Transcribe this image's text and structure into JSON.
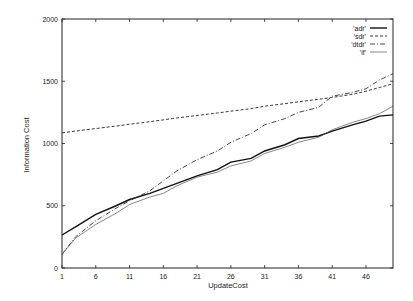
{
  "chart_data": {
    "type": "line",
    "title": "",
    "xlabel": "UpdateCost",
    "ylabel": "Information Cost",
    "xlim": [
      1,
      50
    ],
    "ylim": [
      0,
      2000
    ],
    "xticks": [
      1,
      6,
      11,
      16,
      21,
      26,
      31,
      36,
      41,
      46
    ],
    "yticks": [
      0,
      500,
      1000,
      1500,
      2000
    ],
    "grid": false,
    "legend_position": "top-right",
    "x": [
      1,
      3,
      6,
      9,
      11,
      14,
      16,
      18,
      21,
      24,
      26,
      29,
      31,
      34,
      36,
      39,
      41,
      44,
      46,
      48,
      50
    ],
    "series": [
      {
        "name": "'adr'",
        "style": "solid-thick",
        "values": [
          265,
          330,
          430,
          500,
          550,
          600,
          640,
          680,
          740,
          790,
          850,
          880,
          940,
          990,
          1040,
          1060,
          1100,
          1150,
          1180,
          1220,
          1230
        ]
      },
      {
        "name": "'sdr'",
        "style": "dashed",
        "values": [
          1085,
          1100,
          1120,
          1140,
          1155,
          1175,
          1190,
          1205,
          1225,
          1245,
          1260,
          1280,
          1300,
          1320,
          1335,
          1355,
          1370,
          1395,
          1420,
          1450,
          1480
        ]
      },
      {
        "name": "'dtdr'",
        "style": "dash-dot",
        "values": [
          110,
          250,
          380,
          480,
          540,
          620,
          700,
          780,
          870,
          940,
          1010,
          1080,
          1150,
          1200,
          1250,
          1290,
          1380,
          1410,
          1440,
          1510,
          1560
        ]
      },
      {
        "name": "'if'",
        "style": "solid-thin",
        "values": [
          110,
          240,
          350,
          440,
          510,
          570,
          600,
          660,
          730,
          770,
          820,
          860,
          920,
          970,
          1010,
          1050,
          1110,
          1170,
          1200,
          1240,
          1300
        ]
      }
    ]
  }
}
